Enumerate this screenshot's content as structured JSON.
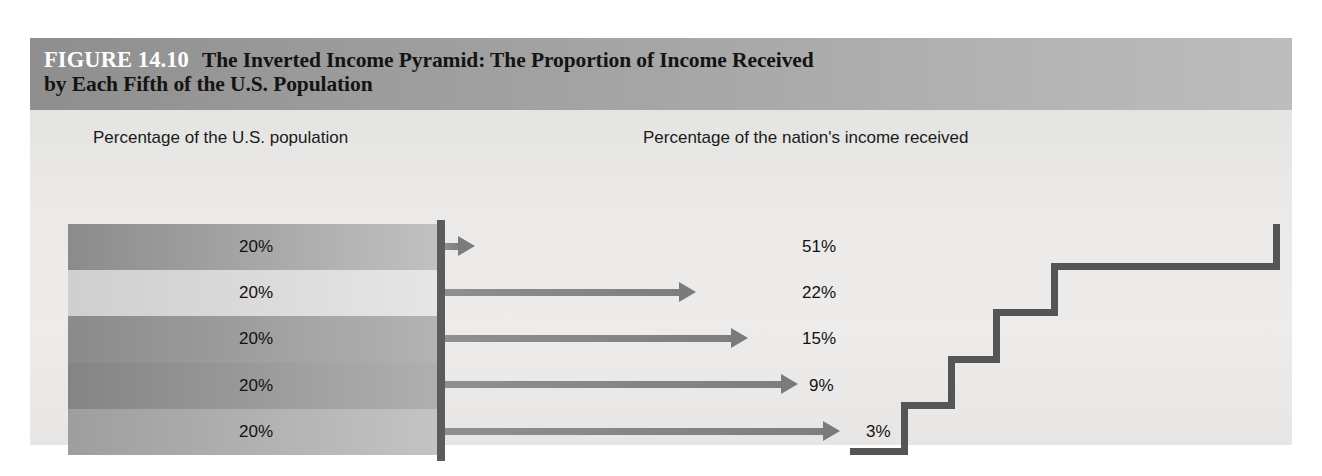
{
  "figure": {
    "number_label": "FIGURE 14.10",
    "title_line1": "The Inverted Income Pyramid: The Proportion of Income Received",
    "title_line2": "by Each Fifth of the U.S. Population"
  },
  "headers": {
    "left": "Percentage of the U.S. population",
    "right": "Percentage of the nation's income received"
  },
  "colors": {
    "title_band_dark": "#8e8e8e",
    "title_band_light": "#bdbdbd",
    "panel_bg": "#ecebe9",
    "divider": "#5c5c5c",
    "step_edge": "#555555",
    "arrow": "#7b7b7b",
    "text": "#121212",
    "fig_label_text": "#ffffff"
  },
  "chart_data": {
    "type": "bar",
    "title": "The Inverted Income Pyramid: The Proportion of Income Received by Each Fifth of the U.S. Population",
    "xlabel": "",
    "ylabel": "",
    "categories": [
      "Top fifth",
      "Second fifth",
      "Third fifth",
      "Fourth fifth",
      "Bottom fifth"
    ],
    "series": [
      {
        "name": "Percentage of the U.S. population",
        "values": [
          20,
          20,
          20,
          20,
          20
        ],
        "labels": [
          "20%",
          "20%",
          "20%",
          "20%",
          "20%"
        ]
      },
      {
        "name": "Percentage of the nation's income received",
        "values": [
          51,
          22,
          15,
          9,
          3
        ],
        "labels": [
          "51%",
          "22%",
          "15%",
          "9%",
          "3%"
        ]
      }
    ],
    "grid": false,
    "legend": "none"
  },
  "population_rows": [
    {
      "label": "20%",
      "top": 0,
      "shade_from": "#8b8b8b",
      "shade_to": "#c2c2c2"
    },
    {
      "label": "20%",
      "top": 46.2,
      "shade_from": "#cfcfcf",
      "shade_to": "#e6e6e6"
    },
    {
      "label": "20%",
      "top": 92.4,
      "shade_from": "#8a8a8a",
      "shade_to": "#b4b4b4"
    },
    {
      "label": "20%",
      "top": 138.6,
      "shade_from": "#848484",
      "shade_to": "#b0b0b0"
    },
    {
      "label": "20%",
      "top": 184.8,
      "shade_from": "#9e9e9e",
      "shade_to": "#c4c4c4"
    }
  ],
  "income_rows": [
    {
      "label": "51%",
      "left": 462,
      "width": 788,
      "top": 114,
      "label_left": 772,
      "shade_from": "#7c7c7c",
      "shade_to": "#c0c0c0"
    },
    {
      "label": "22%",
      "left": 683,
      "width": 345,
      "top": 160.2,
      "label_left": 772,
      "shade_from": "#c6c6c6",
      "shade_to": "#dcdcdc"
    },
    {
      "label": "15%",
      "left": 735,
      "width": 235,
      "top": 206.4,
      "label_left": 772,
      "shade_from": "#848484",
      "shade_to": "#b8b8b8"
    },
    {
      "label": "9%",
      "left": 785,
      "width": 140,
      "top": 252.6,
      "label_left": 779,
      "shade_from": "#8d8d8d",
      "shade_to": "#bdbdbd"
    },
    {
      "label": "3%",
      "left": 827,
      "width": 51,
      "top": 298.8,
      "label_left": 836,
      "shade_from": "#9b9b9b",
      "shade_to": "#c6c6c6"
    }
  ],
  "arrows": [
    {
      "top": 132,
      "left": 415,
      "length": 30
    },
    {
      "top": 178,
      "left": 415,
      "length": 251
    },
    {
      "top": 224,
      "left": 415,
      "length": 303
    },
    {
      "top": 270,
      "left": 415,
      "length": 353
    },
    {
      "top": 316.5,
      "left": 415,
      "length": 395
    }
  ]
}
